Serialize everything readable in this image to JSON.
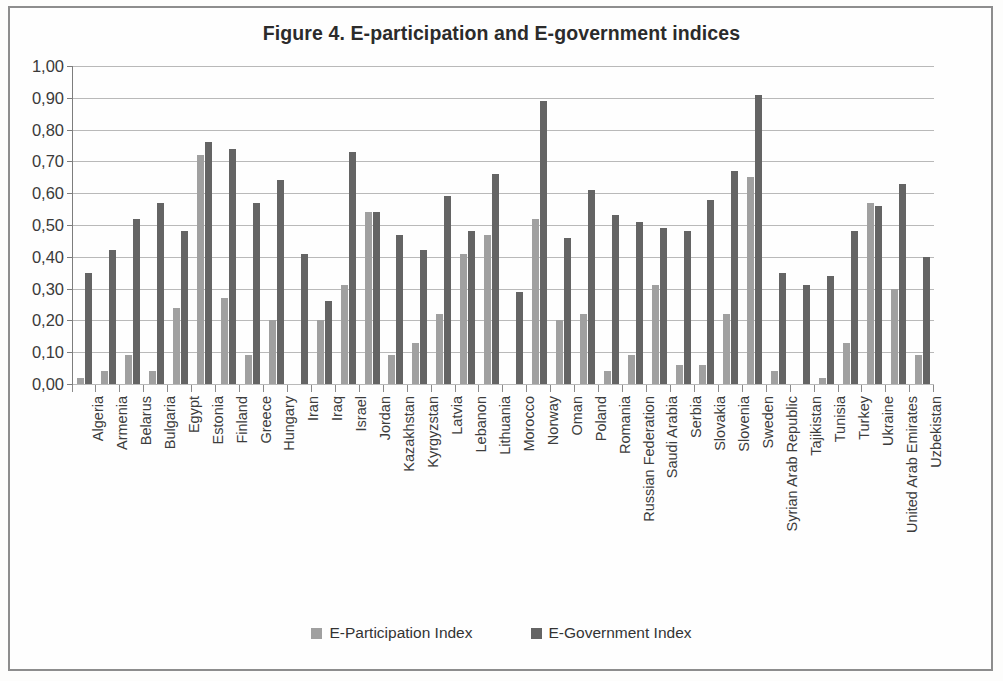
{
  "figure": {
    "title": "Figure 4.  E-participation and E-government indices"
  },
  "legend": {
    "items": [
      {
        "label": "E-Participation Index",
        "color": "#a0a0a0",
        "icon": "square-swatch-icon"
      },
      {
        "label": "E-Government Index",
        "color": "#646464",
        "icon": "square-swatch-icon"
      }
    ]
  },
  "axis": {
    "y_tick_labels": [
      "1,00",
      "0,90",
      "0,80",
      "0,70",
      "0,60",
      "0,50",
      "0,40",
      "0,30",
      "0,20",
      "0,10",
      "0,00"
    ]
  },
  "chart_data": {
    "type": "bar",
    "title": "Figure 4.  E-participation and E-government indices",
    "xlabel": "",
    "ylabel": "",
    "ylim": [
      0,
      1.0
    ],
    "ytick_values": [
      0.0,
      0.1,
      0.2,
      0.3,
      0.4,
      0.5,
      0.6,
      0.7,
      0.8,
      0.9,
      1.0
    ],
    "grid": true,
    "legend_position": "bottom",
    "decimal_separator": ",",
    "categories": [
      "Algeria",
      "Armenia",
      "Belarus",
      "Bulgaria",
      "Egypt",
      "Estonia",
      "Finland",
      "Greece",
      "Hungary",
      "Iran",
      "Iraq",
      "Israel",
      "Jordan",
      "Kazakhstan",
      "Kyrgyzstan",
      "Latvia",
      "Lebanon",
      "Lithuania",
      "Morocco",
      "Norway",
      "Oman",
      "Poland",
      "Romania",
      "Russian Federation",
      "Saudi Arabia",
      "Serbia",
      "Slovakia",
      "Slovenia",
      "Sweden",
      "Syrian Arab Republic",
      "Tajikistan",
      "Tunisia",
      "Turkey",
      "Ukraine",
      "United Arab Emirates",
      "Uzbekistan"
    ],
    "series": [
      {
        "name": "E-Participation Index",
        "color": "#a0a0a0",
        "values": [
          0.02,
          0.04,
          0.09,
          0.04,
          0.24,
          0.72,
          0.27,
          0.09,
          0.2,
          0.0,
          0.2,
          0.31,
          0.54,
          0.09,
          0.13,
          0.22,
          0.41,
          0.47,
          0.0,
          0.52,
          0.2,
          0.22,
          0.04,
          0.09,
          0.31,
          0.06,
          0.06,
          0.22,
          0.65,
          0.04,
          0.0,
          0.02,
          0.13,
          0.57,
          0.3,
          0.09
        ]
      },
      {
        "name": "E-Government Index",
        "color": "#646464",
        "values": [
          0.35,
          0.42,
          0.52,
          0.57,
          0.48,
          0.76,
          0.74,
          0.57,
          0.64,
          0.41,
          0.26,
          0.73,
          0.54,
          0.47,
          0.42,
          0.59,
          0.48,
          0.66,
          0.29,
          0.89,
          0.46,
          0.61,
          0.53,
          0.51,
          0.49,
          0.48,
          0.58,
          0.67,
          0.91,
          0.35,
          0.31,
          0.34,
          0.48,
          0.56,
          0.63,
          0.4
        ]
      }
    ]
  }
}
